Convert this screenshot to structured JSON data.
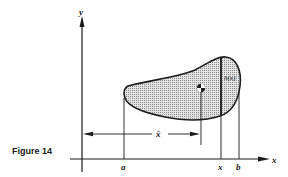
{
  "figure": {
    "caption": "Figure 14",
    "axes": {
      "x_label": "x",
      "y_label": "y"
    },
    "tick_labels": [
      "a",
      "x",
      "b"
    ],
    "region_label": "h(x)",
    "dimension_label": "x̄",
    "centroid_marker": "centroid-symbol",
    "colors": {
      "ink": "#1a1a1a",
      "fill": "#c8c8c8"
    }
  }
}
